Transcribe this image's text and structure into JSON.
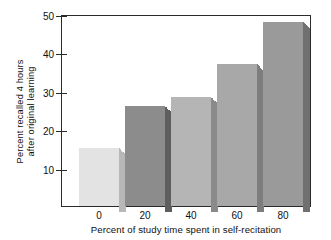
{
  "chart_data": {
    "type": "bar",
    "title": "",
    "xlabel": "Percent of study time spent in self-recitation",
    "ylabel": "Percent recalled 4 hours after original learning",
    "ylabel_line1": "Percent recalled 4 hours",
    "ylabel_line2": "after original learning",
    "categories": [
      "0",
      "20",
      "40",
      "60",
      "80"
    ],
    "values": [
      15,
      26,
      28.5,
      37,
      48
    ],
    "xtick_labels": [
      "0",
      "20",
      "40",
      "60",
      "80"
    ],
    "ytick_labels": [
      "10",
      "20",
      "30",
      "40",
      "50"
    ],
    "ytick_values": [
      10,
      20,
      30,
      40,
      50
    ],
    "ylim": [
      0,
      50
    ],
    "grid": false,
    "legend": "none",
    "bar_style": "3d-shaded",
    "bar_colors": [
      "#e3e3e3",
      "#8c8c8c",
      "#b5b5b5",
      "#a8a8a8",
      "#9a9a9a"
    ],
    "bar_side_colors": [
      "#b8b8b8",
      "#5e5e5e",
      "#8a8a8a",
      "#7d7d7d",
      "#707070"
    ],
    "frame_color": "#2b2b2b",
    "background_color": "#ffffff"
  }
}
